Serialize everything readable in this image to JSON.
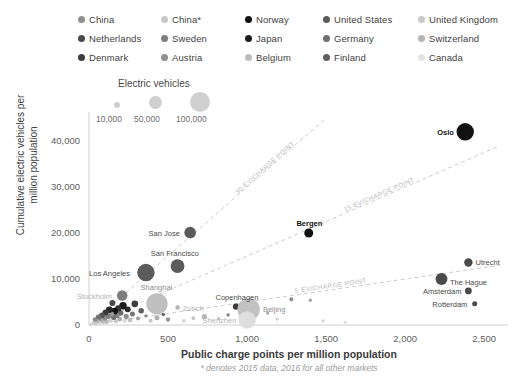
{
  "legend": {
    "rows": [
      [
        {
          "label": "China",
          "color": "#8f8f8f"
        },
        {
          "label": "China*",
          "color": "#c9c9c9"
        },
        {
          "label": "Norway",
          "color": "#111111"
        },
        {
          "label": "United States",
          "color": "#5b5b5b"
        },
        {
          "label": "United Kingdom",
          "color": "#c9c9c9"
        }
      ],
      [
        {
          "label": "Netherlands",
          "color": "#4a4a4a"
        },
        {
          "label": "Sweden",
          "color": "#7d7d7d"
        },
        {
          "label": "Japan",
          "color": "#1b1b1b"
        },
        {
          "label": "Germany",
          "color": "#707070"
        },
        {
          "label": "Switzerland",
          "color": "#b5b5b5"
        }
      ],
      [
        {
          "label": "Denmark",
          "color": "#3c3c3c"
        },
        {
          "label": "Austria",
          "color": "#909090"
        },
        {
          "label": "Belgium",
          "color": "#bdbdbd"
        },
        {
          "label": "Finland",
          "color": "#5e5e5e"
        },
        {
          "label": "Canada",
          "color": "#e4e4e4"
        }
      ]
    ]
  },
  "size_legend": {
    "title": "Electric vehicles",
    "ticks": [
      "10,000",
      "50,000",
      "100,000"
    ]
  },
  "chart_data": {
    "type": "scatter",
    "title": "",
    "xlabel": "Public charge points per million population",
    "ylabel": "Cumulative electric vehicles per million population",
    "note": "* denotes 2015 data, 2016 for all other markets",
    "xlim": [
      0,
      2600
    ],
    "ylim": [
      0,
      45000
    ],
    "xticks": [
      0,
      500,
      1000,
      1500,
      2000,
      2500
    ],
    "xticklabels": [
      "0",
      "500",
      "1,000",
      "1,500",
      "2,000",
      "2,500"
    ],
    "yticks": [
      0,
      10000,
      20000,
      30000,
      40000
    ],
    "yticklabels": [
      "0",
      "10,000",
      "20,000",
      "30,000",
      "40,000"
    ],
    "grid": false,
    "legend_position": "top",
    "size_encoding": "Electric vehicles",
    "reference_lines": [
      {
        "label": "30 EV/CHARGE POINT",
        "slope": 30,
        "style": "dashed",
        "color": "#cdcdcd"
      },
      {
        "label": "15 EV/CHARGE POINT",
        "slope": 15,
        "style": "dashed",
        "color": "#cdcdcd"
      },
      {
        "label": "5 EV/CHARGE POINT",
        "slope": 5,
        "style": "dashed",
        "color": "#cdcdcd"
      }
    ],
    "points": [
      {
        "name": "Oslo",
        "x": 2380,
        "y": 42000,
        "ev": 60000,
        "color": "#111111",
        "label_pos": "left",
        "label_style": "bold"
      },
      {
        "name": "Utrecht",
        "x": 2400,
        "y": 13600,
        "ev": 14000,
        "color": "#4a4a4a",
        "label_pos": "right",
        "label_style": "normal"
      },
      {
        "name": "Amsterdam",
        "x": 2230,
        "y": 10000,
        "ev": 28000,
        "color": "#4a4a4a",
        "label_pos": "below",
        "label_style": "normal"
      },
      {
        "name": "The Hague",
        "x": 2400,
        "y": 7400,
        "ev": 9000,
        "color": "#4a4a4a",
        "label_pos": "above",
        "label_style": "normal"
      },
      {
        "name": "Rotterdam",
        "x": 2440,
        "y": 4600,
        "ev": 5000,
        "color": "#4a4a4a",
        "label_pos": "left",
        "label_style": "normal"
      },
      {
        "name": "Bergen",
        "x": 1390,
        "y": 20000,
        "ev": 16000,
        "color": "#111111",
        "label_pos": "above",
        "label_style": "bold"
      },
      {
        "name": "San Jose",
        "x": 640,
        "y": 20100,
        "ev": 27000,
        "color": "#5b5b5b",
        "label_pos": "left",
        "label_style": "normal"
      },
      {
        "name": "San Francisco",
        "x": 560,
        "y": 12800,
        "ev": 38000,
        "color": "#5b5b5b",
        "label_pos": "above",
        "label_style": "normal"
      },
      {
        "name": "Los Angeles",
        "x": 360,
        "y": 11400,
        "ev": 60000,
        "color": "#5b5b5b",
        "label_pos": "left",
        "label_style": "normal"
      },
      {
        "name": "Stockholm",
        "x": 210,
        "y": 6400,
        "ev": 22000,
        "color": "#7d7d7d",
        "label_pos": "left",
        "label_style": "faint"
      },
      {
        "name": "Shanghai",
        "x": 430,
        "y": 4600,
        "ev": 90000,
        "color": "#bfbfbf",
        "label_pos": "above",
        "label_style": "mid"
      },
      {
        "name": "Zurich",
        "x": 560,
        "y": 3800,
        "ev": 4000,
        "color": "#b5b5b5",
        "label_pos": "right",
        "label_style": "faint"
      },
      {
        "name": "Copenhagen",
        "x": 930,
        "y": 4000,
        "ev": 8000,
        "color": "#3c3c3c",
        "label_pos": "above",
        "label_style": "normal"
      },
      {
        "name": "Beijing",
        "x": 1010,
        "y": 3400,
        "ev": 100000,
        "color": "#c2c2c2",
        "label_pos": "right",
        "label_style": "mid"
      },
      {
        "name": "Shenzhen",
        "x": 1000,
        "y": 1100,
        "ev": 60000,
        "color": "#dedede",
        "label_pos": "left",
        "label_style": "faint"
      }
    ],
    "unlabeled_points": [
      {
        "x": 1280,
        "y": 5600,
        "ev": 3000,
        "color": "#8a8a8a"
      },
      {
        "x": 1400,
        "y": 5400,
        "ev": 1600,
        "color": "#9c9c9c"
      },
      {
        "x": 1130,
        "y": 2600,
        "ev": 2000,
        "color": "#a8a8a8"
      },
      {
        "x": 1190,
        "y": 1300,
        "ev": 1500,
        "color": "#cfcfcf"
      },
      {
        "x": 880,
        "y": 2200,
        "ev": 1200,
        "color": "#777777"
      },
      {
        "x": 820,
        "y": 1400,
        "ev": 1400,
        "color": "#bdbdbd"
      },
      {
        "x": 730,
        "y": 1800,
        "ev": 6000,
        "color": "#b8b8b8"
      },
      {
        "x": 660,
        "y": 1500,
        "ev": 3000,
        "color": "#c4c4c4"
      },
      {
        "x": 600,
        "y": 900,
        "ev": 2600,
        "color": "#d2d2d2"
      },
      {
        "x": 500,
        "y": 1200,
        "ev": 4000,
        "color": "#9a9a9a"
      },
      {
        "x": 470,
        "y": 2300,
        "ev": 2500,
        "color": "#6d6d6d"
      },
      {
        "x": 430,
        "y": 1600,
        "ev": 5000,
        "color": "#b0b0b0"
      },
      {
        "x": 390,
        "y": 900,
        "ev": 3200,
        "color": "#c7c7c7"
      },
      {
        "x": 360,
        "y": 2000,
        "ev": 2200,
        "color": "#8a8a8a"
      },
      {
        "x": 330,
        "y": 3100,
        "ev": 6000,
        "color": "#5e5e5e"
      },
      {
        "x": 310,
        "y": 1400,
        "ev": 3000,
        "color": "#a0a0a0"
      },
      {
        "x": 290,
        "y": 4600,
        "ev": 9000,
        "color": "#3f3f3f"
      },
      {
        "x": 275,
        "y": 2400,
        "ev": 5000,
        "color": "#767676"
      },
      {
        "x": 260,
        "y": 1100,
        "ev": 4000,
        "color": "#bfbfbf"
      },
      {
        "x": 245,
        "y": 3400,
        "ev": 7000,
        "color": "#2a2a2a"
      },
      {
        "x": 235,
        "y": 1900,
        "ev": 5500,
        "color": "#8f8f8f"
      },
      {
        "x": 225,
        "y": 900,
        "ev": 3000,
        "color": "#d6d6d6"
      },
      {
        "x": 215,
        "y": 4200,
        "ev": 11000,
        "color": "#1b1b1b"
      },
      {
        "x": 200,
        "y": 2600,
        "ev": 6000,
        "color": "#6a6a6a"
      },
      {
        "x": 195,
        "y": 1300,
        "ev": 4500,
        "color": "#ababab"
      },
      {
        "x": 185,
        "y": 3600,
        "ev": 8000,
        "color": "#333333"
      },
      {
        "x": 178,
        "y": 2000,
        "ev": 5000,
        "color": "#858585"
      },
      {
        "x": 170,
        "y": 800,
        "ev": 3500,
        "color": "#c9c9c9"
      },
      {
        "x": 162,
        "y": 3000,
        "ev": 9000,
        "color": "#111111"
      },
      {
        "x": 155,
        "y": 1700,
        "ev": 6500,
        "color": "#707070"
      },
      {
        "x": 148,
        "y": 4800,
        "ev": 7000,
        "color": "#4a4a4a"
      },
      {
        "x": 142,
        "y": 2400,
        "ev": 5200,
        "color": "#9a9a9a"
      },
      {
        "x": 135,
        "y": 1000,
        "ev": 4000,
        "color": "#d0d0d0"
      },
      {
        "x": 128,
        "y": 3300,
        "ev": 8500,
        "color": "#262626"
      },
      {
        "x": 120,
        "y": 1900,
        "ev": 6000,
        "color": "#7f7f7f"
      },
      {
        "x": 112,
        "y": 700,
        "ev": 3800,
        "color": "#bcbcbc"
      },
      {
        "x": 105,
        "y": 2700,
        "ev": 7200,
        "color": "#3a3a3a"
      },
      {
        "x": 98,
        "y": 1400,
        "ev": 5000,
        "color": "#8c8c8c"
      },
      {
        "x": 90,
        "y": 600,
        "ev": 3000,
        "color": "#c4c4c4"
      },
      {
        "x": 82,
        "y": 2100,
        "ev": 6800,
        "color": "#545454"
      },
      {
        "x": 75,
        "y": 1100,
        "ev": 4200,
        "color": "#a3a3a3"
      },
      {
        "x": 68,
        "y": 400,
        "ev": 2600,
        "color": "#dadada"
      },
      {
        "x": 60,
        "y": 1700,
        "ev": 5600,
        "color": "#6f6f6f"
      },
      {
        "x": 52,
        "y": 800,
        "ev": 3400,
        "color": "#b1b1b1"
      },
      {
        "x": 45,
        "y": 300,
        "ev": 2000,
        "color": "#cecece"
      },
      {
        "x": 38,
        "y": 1200,
        "ev": 4400,
        "color": "#8b8b8b"
      },
      {
        "x": 30,
        "y": 500,
        "ev": 2800,
        "color": "#c0c0c0"
      },
      {
        "x": 22,
        "y": 200,
        "ev": 1800,
        "color": "#d8d8d8"
      },
      {
        "x": 1480,
        "y": 900,
        "ev": 1200,
        "color": "#d4d4d4"
      },
      {
        "x": 1620,
        "y": 600,
        "ev": 900,
        "color": "#dcdcdc"
      }
    ]
  }
}
